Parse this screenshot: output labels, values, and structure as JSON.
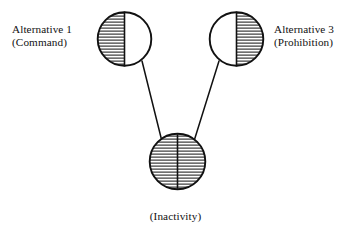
{
  "figure": {
    "background_color": "#ffffff",
    "stroke_color": "#111111",
    "hatch_color": "#1a1a1a",
    "nodes": [
      {
        "id": "alternative-1",
        "label_line1": "Alternative 1",
        "label_line2": "(Command)",
        "label_position": "left",
        "shape": "circle",
        "cx": 124.5,
        "cy": 39,
        "r": 27.5,
        "fill_pattern": "left-half-hatched",
        "divider": "vertical"
      },
      {
        "id": "alternative-3",
        "label_line1": "Alternative 3",
        "label_line2": "(Prohibition)",
        "label_position": "right",
        "shape": "circle",
        "cx": 236.5,
        "cy": 39,
        "r": 27.5,
        "fill_pattern": "right-half-hatched",
        "divider": "vertical"
      },
      {
        "id": "inactivity",
        "label_line1": "(Inactivity)",
        "label_line2": "",
        "label_position": "bottom",
        "shape": "circle",
        "cx": 177.5,
        "cy": 161.5,
        "r": 28.5,
        "fill_pattern": "full-hatched",
        "divider": "vertical"
      }
    ],
    "edges": [
      {
        "id": "edge-alt1-inactivity",
        "from": "alternative-1",
        "to": "inactivity",
        "x1": 142,
        "y1": 61,
        "x2": 161,
        "y2": 139
      },
      {
        "id": "edge-alt3-inactivity",
        "from": "alternative-3",
        "to": "inactivity",
        "x1": 219,
        "y1": 61,
        "x2": 195,
        "y2": 139
      }
    ],
    "hatch_spacing_px": 3,
    "hatch_line_width_px": 1,
    "outline_width_px": 1.8
  },
  "labels": {
    "left_line1": "Alternative 1",
    "left_line2": "(Command)",
    "right_line1": "Alternative 3",
    "right_line2": "(Prohibition)",
    "bottom": "(Inactivity)"
  }
}
